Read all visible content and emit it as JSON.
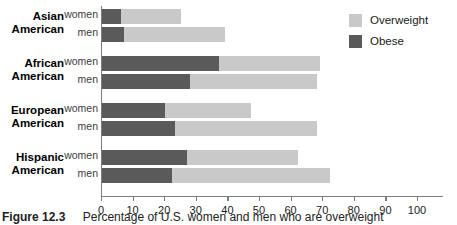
{
  "figure": {
    "caption_number": "Figure 12.3",
    "caption_text": "Percentage of U.S. women and men who are overweight"
  },
  "legend": {
    "position": "top-right",
    "items": [
      {
        "label": "Overweight",
        "color": "#c9c9c9",
        "icon": "legend-swatch-overweight"
      },
      {
        "label": "Obese",
        "color": "#5a5a5a",
        "icon": "legend-swatch-obese"
      }
    ]
  },
  "axis": {
    "ticks": [
      0,
      10,
      20,
      30,
      40,
      50,
      60,
      70,
      80,
      90,
      100
    ],
    "min": 0,
    "max": 108,
    "unit": "percent"
  },
  "groups": [
    {
      "name": "Asian\nAmerican",
      "line1": "Asian",
      "line2": "American",
      "rows": [
        {
          "label": "women"
        },
        {
          "label": "men"
        }
      ]
    },
    {
      "name": "African\nAmerican",
      "line1": "African",
      "line2": "American",
      "rows": [
        {
          "label": "women"
        },
        {
          "label": "men"
        }
      ]
    },
    {
      "name": "European\nAmerican",
      "line1": "European",
      "line2": "American",
      "rows": [
        {
          "label": "women"
        },
        {
          "label": "men"
        }
      ]
    },
    {
      "name": "Hispanic\nAmerican",
      "line1": "Hispanic",
      "line2": "American",
      "rows": [
        {
          "label": "women"
        },
        {
          "label": "men"
        }
      ]
    }
  ],
  "chart_data": {
    "type": "bar",
    "orientation": "horizontal",
    "stacked": true,
    "title": "Percentage of U.S. women and men who are overweight",
    "xlabel": "",
    "ylabel": "",
    "xlim": [
      0,
      108
    ],
    "grid": false,
    "legend_position": "top-right",
    "categories": [
      "Asian American women",
      "Asian American men",
      "African American women",
      "African American men",
      "European American women",
      "European American men",
      "Hispanic American women",
      "Hispanic American men"
    ],
    "series": [
      {
        "name": "Obese",
        "color": "#5a5a5a",
        "values": [
          6,
          7,
          37,
          28,
          20,
          23,
          27,
          22
        ]
      },
      {
        "name": "Overweight",
        "color": "#c9c9c9",
        "values": [
          19,
          32,
          32,
          40,
          27,
          45,
          35,
          50
        ]
      }
    ],
    "totals": [
      25,
      39,
      69,
      68,
      47,
      68,
      62,
      72
    ]
  }
}
